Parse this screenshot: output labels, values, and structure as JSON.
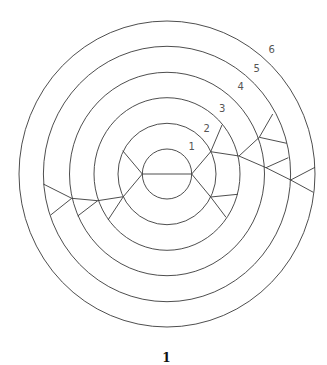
{
  "figure": {
    "caption": "1",
    "center": {
      "x": 167,
      "y": 174
    },
    "line_color": "#3a3a3a",
    "rings": [
      {
        "label": "1",
        "rx": 24.7,
        "ry": 25,
        "label_pos": {
          "x": 191.7,
          "y": 150
        }
      },
      {
        "label": "2",
        "rx": 49,
        "ry": 50.7,
        "label_pos": {
          "x": 206.7,
          "y": 131.5
        }
      },
      {
        "label": "3",
        "rx": 73,
        "ry": 76.3,
        "label_pos": {
          "x": 222.3,
          "y": 112
        }
      },
      {
        "label": "4",
        "rx": 97.5,
        "ry": 101.7,
        "label_pos": {
          "x": 240.7,
          "y": 89.5
        }
      },
      {
        "label": "5",
        "rx": 123.6,
        "ry": 127.7,
        "label_pos": {
          "x": 256.7,
          "y": 72
        }
      },
      {
        "label": "6",
        "rx": 148,
        "ry": 153,
        "label_pos": {
          "x": 271.7,
          "y": 53
        }
      }
    ],
    "edges": [
      [
        142.3,
        174,
        191.7,
        174
      ],
      [
        142.3,
        174,
        122.7,
        150.7
      ],
      [
        142.3,
        174,
        123.3,
        196.7
      ],
      [
        123.3,
        196.7,
        108.0,
        220
      ],
      [
        123.3,
        196.7,
        97.7,
        200.7
      ],
      [
        97.7,
        200.7,
        77.7,
        216
      ],
      [
        97.7,
        200.7,
        71.7,
        198.3
      ],
      [
        71.7,
        198.3,
        43.3,
        184
      ],
      [
        71.7,
        198.3,
        50.7,
        215
      ],
      [
        191.7,
        174,
        210.7,
        151.7
      ],
      [
        210.7,
        151.7,
        222,
        125
      ],
      [
        210.7,
        151.7,
        239,
        156
      ],
      [
        239,
        156,
        259.3,
        137.3
      ],
      [
        239,
        156,
        266,
        167.7
      ],
      [
        259.3,
        137.3,
        272.7,
        114
      ],
      [
        259.3,
        137.3,
        286.7,
        143.3
      ],
      [
        266,
        167.7,
        288.3,
        157.7
      ],
      [
        266,
        167.7,
        290.7,
        180
      ],
      [
        290.7,
        180,
        315,
        167.3
      ],
      [
        290.7,
        180,
        313.3,
        192.3
      ],
      [
        191.7,
        174,
        210.7,
        197
      ],
      [
        210.7,
        197,
        237.7,
        194.3
      ],
      [
        210.7,
        197,
        226,
        217.3
      ]
    ]
  }
}
